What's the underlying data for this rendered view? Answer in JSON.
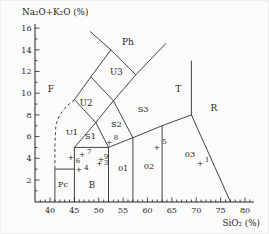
{
  "colors": {
    "ink": "#222222",
    "background": "#fbfbf9"
  },
  "chart_data": {
    "type": "scatter",
    "xlabel": "SiO₂ (%)",
    "ylabel": "Na₂O+K₂O (%)",
    "xlim": [
      36.9,
      81.8
    ],
    "ylim": [
      0,
      16.4
    ],
    "x_ticks": [
      40,
      45,
      50,
      55,
      60,
      65,
      70,
      75,
      80
    ],
    "y_ticks": [
      2,
      4,
      6,
      8,
      10,
      12,
      14,
      16
    ],
    "minor_tick_step": 1,
    "grid": false,
    "legend": "none",
    "fields": [
      {
        "label": "F",
        "x": 40.2,
        "y": 10.4,
        "size": 9.2
      },
      {
        "label": "Pc",
        "x": 42.7,
        "y": 1.6,
        "size": 8.2
      },
      {
        "label": "B",
        "x": 48.6,
        "y": 1.5,
        "size": 8.6
      },
      {
        "label": "01",
        "x": 55.0,
        "y": 3.1,
        "size": 8.2
      },
      {
        "label": "02",
        "x": 60.3,
        "y": 3.3,
        "size": 8.2
      },
      {
        "label": "03",
        "x": 68.7,
        "y": 4.4,
        "size": 8.2
      },
      {
        "label": "U1",
        "x": 44.5,
        "y": 6.4,
        "size": 8.2
      },
      {
        "label": "S1",
        "x": 48.3,
        "y": 6.1,
        "size": 8.2
      },
      {
        "label": "S2",
        "x": 53.6,
        "y": 7.2,
        "size": 8.2
      },
      {
        "label": "S3",
        "x": 59.1,
        "y": 8.5,
        "size": 8.2
      },
      {
        "label": "U2",
        "x": 47.4,
        "y": 9.1,
        "size": 8.6
      },
      {
        "label": "U3",
        "x": 53.6,
        "y": 12.0,
        "size": 8.6
      },
      {
        "label": "Ph",
        "x": 56.0,
        "y": 14.7,
        "size": 9.0
      },
      {
        "label": "T",
        "x": 66.3,
        "y": 10.4,
        "size": 9.0
      },
      {
        "label": "R",
        "x": 73.6,
        "y": 8.6,
        "size": 9.0
      }
    ],
    "boundaries": {
      "solid": [
        [
          [
            41,
            0
          ],
          [
            41,
            3
          ],
          [
            45,
            3
          ]
        ],
        [
          [
            45,
            0
          ],
          [
            45,
            5
          ]
        ],
        [
          [
            45,
            5
          ],
          [
            52,
            5
          ]
        ],
        [
          [
            52,
            0
          ],
          [
            52,
            5
          ]
        ],
        [
          [
            45,
            5
          ],
          [
            49.4,
            7.3
          ]
        ],
        [
          [
            49.4,
            7.3
          ],
          [
            52,
            5
          ]
        ],
        [
          [
            52,
            5
          ],
          [
            57,
            5.9
          ]
        ],
        [
          [
            57,
            0
          ],
          [
            57,
            5.9
          ]
        ],
        [
          [
            57,
            5.9
          ],
          [
            63,
            7
          ]
        ],
        [
          [
            63,
            0
          ],
          [
            63,
            7
          ]
        ],
        [
          [
            63,
            7
          ],
          [
            69,
            8
          ]
        ],
        [
          [
            69,
            8
          ],
          [
            69,
            13
          ]
        ],
        [
          [
            69,
            8
          ],
          [
            77,
            0
          ]
        ],
        [
          [
            45,
            9.4
          ],
          [
            49.4,
            7.3
          ]
        ],
        [
          [
            49.4,
            7.3
          ],
          [
            53,
            9.3
          ]
        ],
        [
          [
            45,
            9.4
          ],
          [
            48.4,
            11.5
          ],
          [
            52.5,
            14
          ]
        ],
        [
          [
            48.4,
            11.5
          ],
          [
            53,
            9.3
          ]
        ],
        [
          [
            53,
            9.3
          ],
          [
            57,
            5.9
          ]
        ],
        [
          [
            48.2,
            15.7
          ],
          [
            52.5,
            14
          ],
          [
            57.6,
            11.7
          ]
        ],
        [
          [
            53,
            9.3
          ],
          [
            57.6,
            11.7
          ],
          [
            63.8,
            14.6
          ]
        ]
      ],
      "dashed": [
        [
          [
            45,
            9.4
          ],
          [
            43.4,
            8.8
          ],
          [
            42,
            8
          ],
          [
            41.2,
            7.1
          ],
          [
            41,
            5.3
          ],
          [
            41,
            3
          ]
        ]
      ]
    },
    "points": [
      {
        "label": "1",
        "x": 70.8,
        "y": 3.5,
        "lx": 71.8,
        "ly": 3.9
      },
      {
        "label": "3",
        "x": 50.1,
        "y": 3.5,
        "lx": 51.1,
        "ly": 3.6
      },
      {
        "label": "4",
        "x": 45.9,
        "y": 3.0,
        "lx": 47.0,
        "ly": 3.1
      },
      {
        "label": "5",
        "x": 61.9,
        "y": 5.0,
        "lx": 63.0,
        "ly": 5.5
      },
      {
        "label": "6",
        "x": 44.3,
        "y": 4.1,
        "lx": 45.3,
        "ly": 3.8
      },
      {
        "label": "7",
        "x": 46.6,
        "y": 4.4,
        "lx": 47.6,
        "ly": 4.6
      },
      {
        "label": "8",
        "x": 52.1,
        "y": 5.5,
        "lx": 53.1,
        "ly": 5.9
      },
      {
        "label": "9",
        "x": 50.5,
        "y": 3.9,
        "lx": 51.1,
        "ly": 4.2
      }
    ]
  }
}
